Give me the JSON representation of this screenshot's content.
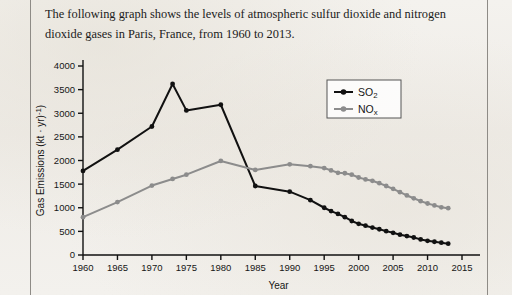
{
  "caption": {
    "line1": "The following graph shows the levels of atmospheric sulfur dioxide and nitrogen",
    "line2": "dioxide gases in Paris, France, from 1960 to 2013."
  },
  "chart_data": {
    "type": "line",
    "title": "",
    "xlabel": "Year",
    "ylabel": "Gas Emissions (kt · yr⁻¹)",
    "xlim": [
      1960,
      2015
    ],
    "ylim": [
      0,
      4000
    ],
    "xticks": [
      1960,
      1965,
      1970,
      1975,
      1980,
      1985,
      1990,
      1995,
      2000,
      2005,
      2010,
      2015
    ],
    "xticklabels": [
      "1960",
      "1965",
      "1970",
      "1975",
      "1980",
      "1985",
      "1990",
      "1995",
      "2000",
      "2005",
      "2010",
      "2015"
    ],
    "yticks": [
      0,
      500,
      1000,
      1500,
      2000,
      2500,
      3000,
      3500,
      4000
    ],
    "yticklabels": [
      "0",
      "500",
      "1000",
      "1500",
      "2000",
      "2500",
      "3000",
      "3500",
      "4000"
    ],
    "grid": false,
    "legend_position": "upper right",
    "series": [
      {
        "name": "SO₂",
        "legend_label": "SO2",
        "color": "#111111",
        "marker": "circle",
        "x": [
          1960,
          1965,
          1970,
          1973,
          1975,
          1980,
          1985,
          1990,
          1993,
          1995,
          1996,
          1997,
          1998,
          1999,
          2000,
          2001,
          2002,
          2003,
          2004,
          2005,
          2006,
          2007,
          2008,
          2009,
          2010,
          2011,
          2012,
          2013
        ],
        "y": [
          1780,
          2230,
          2720,
          3620,
          3060,
          3180,
          1460,
          1340,
          1160,
          1000,
          930,
          870,
          800,
          720,
          660,
          620,
          580,
          545,
          505,
          470,
          430,
          400,
          370,
          330,
          300,
          280,
          260,
          240
        ]
      },
      {
        "name": "NOₓ",
        "legend_label": "NOx",
        "color": "#8c8c8c",
        "marker": "circle",
        "x": [
          1960,
          1965,
          1970,
          1973,
          1975,
          1980,
          1985,
          1990,
          1993,
          1995,
          1996,
          1997,
          1998,
          1999,
          2000,
          2001,
          2002,
          2003,
          2004,
          2005,
          2006,
          2007,
          2008,
          2009,
          2010,
          2011,
          2012,
          2013
        ],
        "y": [
          800,
          1120,
          1470,
          1610,
          1700,
          1990,
          1800,
          1920,
          1880,
          1840,
          1790,
          1740,
          1730,
          1700,
          1640,
          1600,
          1570,
          1520,
          1460,
          1400,
          1330,
          1260,
          1200,
          1140,
          1090,
          1050,
          1010,
          990
        ]
      }
    ]
  }
}
